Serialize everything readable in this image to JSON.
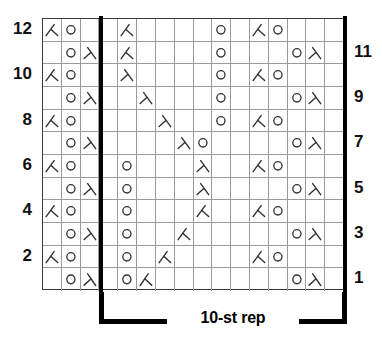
{
  "chart_data": {
    "type": "table",
    "title": "",
    "grid": {
      "columns": 16,
      "rows": 12
    },
    "symbol_legend": {
      "o": "yarn-over",
      "k2tog": "knit-two-together-right-leaning-decrease",
      "ssk": "slip-slip-knit-left-leaning-decrease",
      "blank": "knit-stitch-empty"
    },
    "row_numbers_left": [
      "12",
      "10",
      "8",
      "6",
      "4",
      "2"
    ],
    "row_numbers_right": [
      "11",
      "9",
      "7",
      "5",
      "3",
      "1"
    ],
    "repeat_label": "10-st rep",
    "repeat_start_column": 4,
    "repeat_end_column": 13,
    "colors": {
      "grid_line": "#9a9a9a",
      "border": "#3a3a3a",
      "symbol": "#333333",
      "repeat_line": "#000000",
      "background": "#ffffff"
    },
    "rows": [
      {
        "number": 12,
        "side": "left",
        "cells": [
          "k2tog",
          "o",
          "blank",
          "blank",
          "k2tog",
          "blank",
          "blank",
          "blank",
          "blank",
          "o",
          "blank",
          "k2tog",
          "o",
          "blank",
          "blank",
          "blank"
        ]
      },
      {
        "number": 11,
        "side": "right",
        "cells": [
          "blank",
          "o",
          "ssk",
          "blank",
          "k2tog",
          "blank",
          "blank",
          "blank",
          "blank",
          "o",
          "blank",
          "blank",
          "blank",
          "o",
          "ssk",
          "blank"
        ]
      },
      {
        "number": 10,
        "side": "left",
        "cells": [
          "k2tog",
          "o",
          "blank",
          "blank",
          "ssk",
          "blank",
          "blank",
          "blank",
          "blank",
          "o",
          "blank",
          "k2tog",
          "o",
          "blank",
          "blank",
          "blank"
        ]
      },
      {
        "number": 9,
        "side": "right",
        "cells": [
          "blank",
          "o",
          "ssk",
          "blank",
          "blank",
          "ssk",
          "blank",
          "blank",
          "blank",
          "o",
          "blank",
          "blank",
          "blank",
          "o",
          "ssk",
          "blank"
        ]
      },
      {
        "number": 8,
        "side": "left",
        "cells": [
          "k2tog",
          "o",
          "blank",
          "blank",
          "blank",
          "blank",
          "ssk",
          "blank",
          "blank",
          "o",
          "blank",
          "k2tog",
          "o",
          "blank",
          "blank",
          "blank"
        ]
      },
      {
        "number": 7,
        "side": "right",
        "cells": [
          "blank",
          "o",
          "ssk",
          "blank",
          "blank",
          "blank",
          "blank",
          "ssk",
          "o",
          "blank",
          "blank",
          "blank",
          "blank",
          "o",
          "ssk",
          "blank"
        ]
      },
      {
        "number": 6,
        "side": "left",
        "cells": [
          "k2tog",
          "o",
          "blank",
          "blank",
          "o",
          "blank",
          "blank",
          "blank",
          "ssk",
          "blank",
          "blank",
          "k2tog",
          "o",
          "blank",
          "blank",
          "blank"
        ]
      },
      {
        "number": 5,
        "side": "right",
        "cells": [
          "blank",
          "o",
          "ssk",
          "blank",
          "o",
          "blank",
          "blank",
          "blank",
          "ssk",
          "blank",
          "blank",
          "blank",
          "blank",
          "o",
          "ssk",
          "blank"
        ]
      },
      {
        "number": 4,
        "side": "left",
        "cells": [
          "k2tog",
          "o",
          "blank",
          "blank",
          "o",
          "blank",
          "blank",
          "blank",
          "k2tog",
          "blank",
          "blank",
          "k2tog",
          "o",
          "blank",
          "blank",
          "blank"
        ]
      },
      {
        "number": 3,
        "side": "right",
        "cells": [
          "blank",
          "o",
          "ssk",
          "blank",
          "o",
          "blank",
          "blank",
          "k2tog",
          "blank",
          "blank",
          "blank",
          "blank",
          "blank",
          "o",
          "ssk",
          "blank"
        ]
      },
      {
        "number": 2,
        "side": "left",
        "cells": [
          "k2tog",
          "o",
          "blank",
          "blank",
          "o",
          "blank",
          "k2tog",
          "blank",
          "blank",
          "blank",
          "blank",
          "k2tog",
          "o",
          "blank",
          "blank",
          "blank"
        ]
      },
      {
        "number": 1,
        "side": "right",
        "cells": [
          "blank",
          "o",
          "ssk",
          "blank",
          "o",
          "k2tog",
          "blank",
          "blank",
          "blank",
          "blank",
          "blank",
          "blank",
          "blank",
          "o",
          "ssk",
          "blank"
        ]
      }
    ]
  }
}
